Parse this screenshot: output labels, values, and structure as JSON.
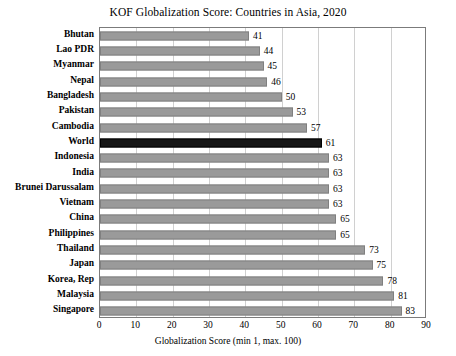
{
  "chart_data": {
    "type": "bar",
    "orientation": "horizontal",
    "title": "KOF Globalization Score: Countries in Asia, 2020",
    "xlabel": "Globalization Score (min 1, max. 100)",
    "ylabel": "",
    "xlim": [
      0,
      90
    ],
    "xticks": [
      0,
      10,
      20,
      30,
      40,
      50,
      60,
      70,
      80,
      90
    ],
    "grid": "vertical",
    "legend": null,
    "highlight_category": "World",
    "colors": {
      "bar": "#9a9a9a",
      "bar_highlight": "#161616",
      "grid": "#d0d0d0",
      "axis": "#7b7b7b",
      "text": "#000000"
    },
    "categories": [
      "Bhutan",
      "Lao PDR",
      "Myanmar",
      "Nepal",
      "Bangladesh",
      "Pakistan",
      "Cambodia",
      "World",
      "Indonesia",
      "India",
      "Brunei Darussalam",
      "Vietnam",
      "China",
      "Philippines",
      "Thailand",
      "Japan",
      "Korea, Rep",
      "Malaysia",
      "Singapore"
    ],
    "values": [
      41,
      44,
      45,
      46,
      50,
      53,
      57,
      61,
      63,
      63,
      63,
      63,
      65,
      65,
      73,
      75,
      78,
      81,
      83
    ]
  }
}
